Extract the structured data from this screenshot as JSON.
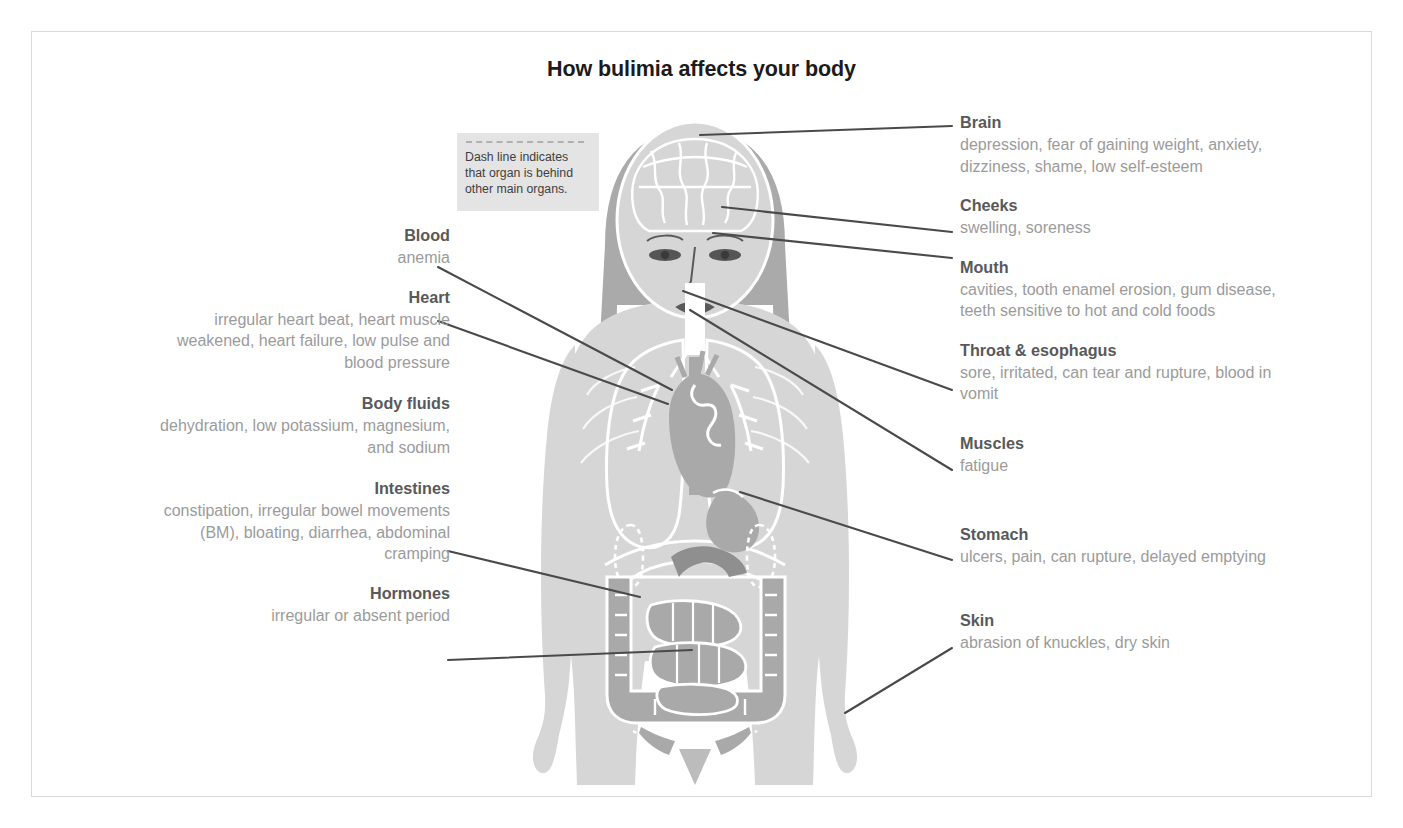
{
  "title": "How bulimia affects your body",
  "legend": {
    "name": "dash-line-legend",
    "text": "Dash line indicates that organ is behind other main  organs."
  },
  "colors": {
    "heading": "#58595b",
    "body_text": "#9b9b9b",
    "title": "#1b1b1b",
    "leader_line": "#4a4a4a",
    "body_fill": "#d6d6d6",
    "hair_fill": "#aaaaaa",
    "organ_dark": "#a9a9a9",
    "organ_outline": "#ffffff",
    "legend_bg": "#e4e4e4",
    "frame_border": "#d9d9d9"
  },
  "left_callouts": [
    {
      "id": "blood",
      "heading": "Blood",
      "body": "anemia"
    },
    {
      "id": "heart",
      "heading": "Heart",
      "body": "irregular heart beat, heart muscle weakened, heart failure, low pulse and blood pressure"
    },
    {
      "id": "body-fluids",
      "heading": "Body fluids",
      "body": "dehydration, low potassium, magnesium, and sodium"
    },
    {
      "id": "intestines",
      "heading": "Intestines",
      "body": "constipation, irregular bowel movements (BM), bloating, diarrhea, abdominal cramping"
    },
    {
      "id": "hormones",
      "heading": "Hormones",
      "body": "irregular or absent period"
    }
  ],
  "right_callouts": [
    {
      "id": "brain",
      "heading": "Brain",
      "body": "depression, fear of gaining weight, anxiety, dizziness, shame, low self-esteem"
    },
    {
      "id": "cheeks",
      "heading": "Cheeks",
      "body": "swelling, soreness"
    },
    {
      "id": "mouth",
      "heading": "Mouth",
      "body": "cavities, tooth enamel erosion, gum disease, teeth sensitive to hot and cold foods"
    },
    {
      "id": "throat-esophagus",
      "heading": "Throat & esophagus",
      "body": "sore, irritated, can tear and rupture, blood in vomit"
    },
    {
      "id": "muscles",
      "heading": "Muscles",
      "body": "fatigue"
    },
    {
      "id": "stomach",
      "heading": "Stomach",
      "body": "ulcers, pain, can rupture, delayed emptying"
    },
    {
      "id": "skin",
      "heading": "Skin",
      "body": "abrasion of knuckles, dry skin"
    }
  ],
  "leader_lines": [
    {
      "name": "leader-blood",
      "x1": 438,
      "y1": 267,
      "x2": 672,
      "y2": 390
    },
    {
      "name": "leader-heart",
      "x1": 438,
      "y1": 321,
      "x2": 668,
      "y2": 404
    },
    {
      "name": "leader-intestines",
      "x1": 448,
      "y1": 551,
      "x2": 640,
      "y2": 597
    },
    {
      "name": "leader-hormones",
      "x1": 448,
      "y1": 660,
      "x2": 692,
      "y2": 650
    },
    {
      "name": "leader-brain",
      "x1": 952,
      "y1": 126,
      "x2": 700,
      "y2": 135
    },
    {
      "name": "leader-cheeks",
      "x1": 952,
      "y1": 232,
      "x2": 722,
      "y2": 207
    },
    {
      "name": "leader-mouth",
      "x1": 952,
      "y1": 258,
      "x2": 713,
      "y2": 233
    },
    {
      "name": "leader-throat",
      "x1": 952,
      "y1": 390,
      "x2": 683,
      "y2": 291
    },
    {
      "name": "leader-muscles",
      "x1": 952,
      "y1": 470,
      "x2": 690,
      "y2": 310
    },
    {
      "name": "leader-stomach",
      "x1": 952,
      "y1": 560,
      "x2": 740,
      "y2": 492
    },
    {
      "name": "leader-skin",
      "x1": 952,
      "y1": 648,
      "x2": 845,
      "y2": 713
    }
  ]
}
